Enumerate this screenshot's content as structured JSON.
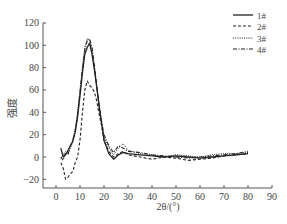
{
  "chart_data": {
    "type": "line",
    "title": "",
    "xlabel": "2θ/(°)",
    "ylabel": "强度",
    "xlim": [
      0,
      90
    ],
    "ylim": [
      -30,
      120
    ],
    "xticks": [
      0,
      10,
      20,
      30,
      40,
      50,
      60,
      70,
      80,
      90
    ],
    "yticks": [
      -20,
      0,
      20,
      40,
      60,
      80,
      100,
      120
    ],
    "grid": false,
    "legend_position": "upper right",
    "series": [
      {
        "name": "1#",
        "style": "solid",
        "x": [
          2,
          3,
          4,
          5,
          6,
          7,
          8,
          9,
          10,
          11,
          12,
          13,
          14,
          15,
          16,
          17,
          18,
          19,
          20,
          22,
          24,
          26,
          28,
          30,
          35,
          40,
          45,
          50,
          55,
          60,
          65,
          70,
          75,
          80
        ],
        "y": [
          8,
          0,
          2,
          6,
          10,
          14,
          22,
          36,
          55,
          75,
          92,
          98,
          102,
          92,
          78,
          62,
          45,
          30,
          15,
          3,
          -2,
          2,
          4,
          3,
          2,
          1,
          0,
          1,
          0,
          -1,
          0,
          1,
          2,
          3
        ]
      },
      {
        "name": "2#",
        "style": "dashed",
        "x": [
          2,
          3,
          4,
          5,
          6,
          7,
          8,
          9,
          10,
          11,
          12,
          13,
          14,
          15,
          16,
          17,
          18,
          19,
          20,
          22,
          24,
          26,
          28,
          30,
          35,
          40,
          45,
          50,
          55,
          60,
          65,
          70,
          75,
          80
        ],
        "y": [
          -5,
          -10,
          -20,
          -18,
          -15,
          -13,
          -5,
          0,
          15,
          40,
          60,
          68,
          64,
          62,
          58,
          50,
          38,
          28,
          15,
          5,
          0,
          3,
          5,
          2,
          0,
          -2,
          0,
          -1,
          -3,
          -2,
          -1,
          1,
          2,
          3
        ]
      },
      {
        "name": "3#",
        "style": "dotted",
        "x": [
          2,
          3,
          4,
          5,
          6,
          7,
          8,
          9,
          10,
          11,
          12,
          13,
          14,
          15,
          16,
          17,
          18,
          19,
          20,
          22,
          24,
          26,
          28,
          30,
          35,
          40,
          45,
          50,
          55,
          60,
          65,
          70,
          75,
          80
        ],
        "y": [
          -2,
          2,
          5,
          3,
          8,
          14,
          25,
          40,
          60,
          80,
          98,
          106,
          104,
          96,
          80,
          62,
          45,
          30,
          18,
          8,
          2,
          8,
          12,
          6,
          3,
          2,
          0,
          2,
          1,
          0,
          2,
          3,
          3,
          4
        ]
      },
      {
        "name": "4#",
        "style": "dashdot",
        "x": [
          2,
          3,
          4,
          5,
          6,
          7,
          8,
          9,
          10,
          11,
          12,
          13,
          14,
          15,
          16,
          17,
          18,
          19,
          20,
          22,
          24,
          26,
          28,
          30,
          35,
          40,
          45,
          50,
          55,
          60,
          65,
          70,
          75,
          80
        ],
        "y": [
          0,
          -3,
          4,
          2,
          10,
          15,
          24,
          38,
          58,
          78,
          96,
          104,
          106,
          98,
          82,
          64,
          46,
          32,
          20,
          10,
          4,
          10,
          8,
          5,
          4,
          2,
          1,
          0,
          -1,
          0,
          1,
          2,
          3,
          5
        ]
      }
    ]
  }
}
